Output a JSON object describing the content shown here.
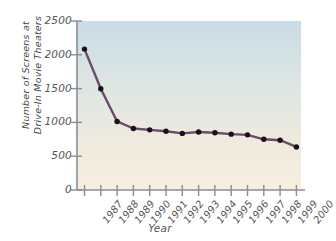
{
  "chart_data": {
    "type": "line",
    "title": "",
    "xlabel": "Year",
    "ylabel": "Number of Screens at Drive-In Movie Theaters",
    "ylabel_lines": [
      "Number of Screens at",
      "Drive-In Movie Theaters"
    ],
    "categories": [
      "1987",
      "1988",
      "1989",
      "1990",
      "1991",
      "1992",
      "1993",
      "1994",
      "1995",
      "1996",
      "1997",
      "1998",
      "1999",
      "2000"
    ],
    "values": [
      2084,
      1497,
      1014,
      910,
      890,
      870,
      837,
      859,
      848,
      826,
      816,
      750,
      737,
      637
    ],
    "series": [
      {
        "name": "Number of Screens",
        "values": [
          2084,
          1497,
          1014,
          910,
          890,
          870,
          837,
          859,
          848,
          826,
          816,
          750,
          737,
          637
        ]
      }
    ],
    "ylim": [
      0,
      2500
    ],
    "yticks": [
      0,
      500,
      1000,
      1500,
      2000,
      2500
    ],
    "ytick_labels": [
      "0",
      "500",
      "1000",
      "1500",
      "2000",
      "2500"
    ],
    "grid": false,
    "legend": "none",
    "line_color": "#6b4a6b",
    "marker_color": "#1a1216",
    "plot_bg_top": "#cbdde6",
    "plot_bg_bottom": "#f5efe1",
    "axis_color": "#8c8c94"
  }
}
